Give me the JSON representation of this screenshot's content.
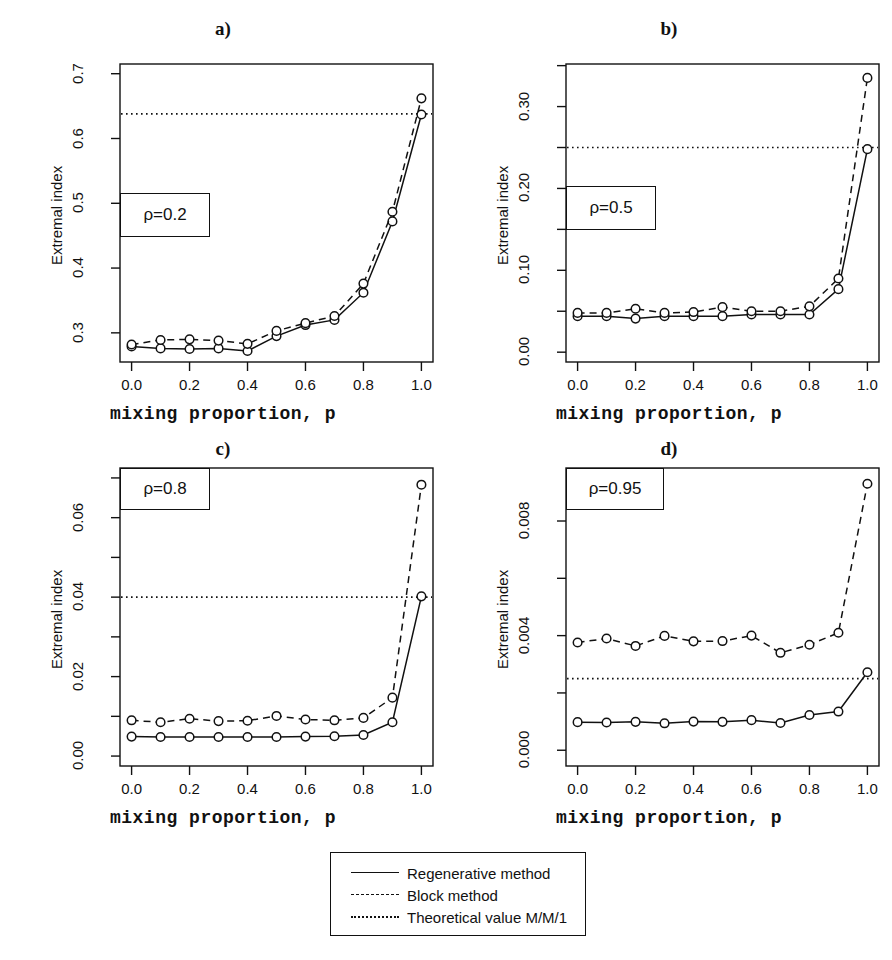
{
  "figure": {
    "width": 892,
    "height": 960,
    "background": "#ffffff",
    "ink_color": "#111111"
  },
  "legend": {
    "name": "figure-legend",
    "entries": [
      {
        "style": "solid",
        "label": "Regenerative method"
      },
      {
        "style": "dashed",
        "label": "Block method"
      },
      {
        "style": "dotted",
        "label": "Theoretical value M/M/1"
      }
    ]
  },
  "chart_data": [
    {
      "panel": "a",
      "type": "line",
      "title": "a)",
      "annotation": "ρ=0.2",
      "xlabel": "mixing proportion, p",
      "ylabel": "Extremal index",
      "x": [
        0.0,
        0.1,
        0.2,
        0.3,
        0.4,
        0.5,
        0.6,
        0.7,
        0.8,
        0.9,
        1.0
      ],
      "xlim": [
        -0.04,
        1.04
      ],
      "ylim": [
        0.255,
        0.715
      ],
      "xticks": [
        0.0,
        0.2,
        0.4,
        0.6,
        0.8,
        1.0
      ],
      "xticklabels": [
        "0.0",
        "0.2",
        "0.4",
        "0.6",
        "0.8",
        "1.0"
      ],
      "yticks": [
        0.3,
        0.4,
        0.5,
        0.6,
        0.7
      ],
      "yticklabels": [
        "0.3",
        "0.4",
        "0.5",
        "0.6",
        "0.7"
      ],
      "grid": false,
      "series": [
        {
          "name": "Regenerative method",
          "style": "solid",
          "values": [
            0.279,
            0.276,
            0.275,
            0.276,
            0.272,
            0.295,
            0.312,
            0.32,
            0.362,
            0.472,
            0.637
          ]
        },
        {
          "name": "Block method",
          "style": "dashed",
          "values": [
            0.282,
            0.289,
            0.29,
            0.288,
            0.283,
            0.303,
            0.315,
            0.326,
            0.376,
            0.487,
            0.662
          ]
        }
      ],
      "hline": {
        "name": "Theoretical value M/M/1",
        "style": "dotted",
        "value": 0.638
      }
    },
    {
      "panel": "b",
      "type": "line",
      "title": "b)",
      "annotation": "ρ=0.5",
      "xlabel": "mixing proportion, p",
      "ylabel": "Extremal index",
      "x": [
        0.0,
        0.1,
        0.2,
        0.3,
        0.4,
        0.5,
        0.6,
        0.7,
        0.8,
        0.9,
        1.0
      ],
      "xlim": [
        -0.04,
        1.04
      ],
      "ylim": [
        -0.012,
        0.352
      ],
      "xticks": [
        0.0,
        0.2,
        0.4,
        0.6,
        0.8,
        1.0
      ],
      "xticklabels": [
        "0.0",
        "0.2",
        "0.4",
        "0.6",
        "0.8",
        "1.0"
      ],
      "yticks": [
        0.0,
        0.1,
        0.2,
        0.3
      ],
      "yticklabels": [
        "0.00",
        "0.10",
        "0.20",
        "0.30"
      ],
      "yminorticks": [
        0.05,
        0.15,
        0.25,
        0.35
      ],
      "grid": false,
      "series": [
        {
          "name": "Regenerative method",
          "style": "solid",
          "values": [
            0.044,
            0.044,
            0.041,
            0.044,
            0.044,
            0.044,
            0.046,
            0.046,
            0.046,
            0.077,
            0.248
          ]
        },
        {
          "name": "Block method",
          "style": "dashed",
          "values": [
            0.048,
            0.048,
            0.053,
            0.048,
            0.049,
            0.055,
            0.05,
            0.05,
            0.056,
            0.09,
            0.335
          ]
        }
      ],
      "hline": {
        "name": "Theoretical value M/M/1",
        "style": "dotted",
        "value": 0.25
      }
    },
    {
      "panel": "c",
      "type": "line",
      "title": "c)",
      "annotation": "ρ=0.8",
      "xlabel": "mixing proportion, p",
      "ylabel": "Extremal index",
      "x": [
        0.0,
        0.1,
        0.2,
        0.3,
        0.4,
        0.5,
        0.6,
        0.7,
        0.8,
        0.9,
        1.0
      ],
      "xlim": [
        -0.04,
        1.04
      ],
      "ylim": [
        -0.0025,
        0.0725
      ],
      "xticks": [
        0.0,
        0.2,
        0.4,
        0.6,
        0.8,
        1.0
      ],
      "xticklabels": [
        "0.0",
        "0.2",
        "0.4",
        "0.6",
        "0.8",
        "1.0"
      ],
      "yticks": [
        0.0,
        0.02,
        0.04,
        0.06
      ],
      "yticklabels": [
        "0.00",
        "0.02",
        "0.04",
        "0.06"
      ],
      "yminorticks": [
        0.01,
        0.03,
        0.05,
        0.07
      ],
      "grid": false,
      "series": [
        {
          "name": "Regenerative method",
          "style": "solid",
          "values": [
            0.0049,
            0.0048,
            0.0048,
            0.0048,
            0.0048,
            0.0048,
            0.0049,
            0.005,
            0.0053,
            0.0085,
            0.0402
          ]
        },
        {
          "name": "Block method",
          "style": "dashed",
          "values": [
            0.009,
            0.0085,
            0.0094,
            0.0088,
            0.0089,
            0.0101,
            0.0092,
            0.009,
            0.0096,
            0.0147,
            0.0683
          ]
        }
      ],
      "hline": {
        "name": "Theoretical value M/M/1",
        "style": "dotted",
        "value": 0.04
      }
    },
    {
      "panel": "d",
      "type": "line",
      "title": "d)",
      "annotation": "ρ=0.95",
      "xlabel": "mixing proportion, p",
      "ylabel": "Extremal index",
      "x": [
        0.0,
        0.1,
        0.2,
        0.3,
        0.4,
        0.5,
        0.6,
        0.7,
        0.8,
        0.9,
        1.0
      ],
      "xlim": [
        -0.04,
        1.04
      ],
      "ylim": [
        -0.00055,
        0.00985
      ],
      "xticks": [
        0.0,
        0.2,
        0.4,
        0.6,
        0.8,
        1.0
      ],
      "xticklabels": [
        "0.0",
        "0.2",
        "0.4",
        "0.6",
        "0.8",
        "1.0"
      ],
      "yticks": [
        0.0,
        0.004,
        0.008
      ],
      "yticklabels": [
        "0.000",
        "0.004",
        "0.008"
      ],
      "yminorticks": [
        0.002,
        0.006
      ],
      "grid": false,
      "series": [
        {
          "name": "Regenerative method",
          "style": "solid",
          "values": [
            0.00098,
            0.00097,
            0.00099,
            0.00094,
            0.001,
            0.00099,
            0.00105,
            0.00095,
            0.00123,
            0.00135,
            0.00272
          ]
        },
        {
          "name": "Block method",
          "style": "dashed",
          "values": [
            0.00376,
            0.0039,
            0.00364,
            0.00399,
            0.0038,
            0.00381,
            0.004,
            0.0034,
            0.00368,
            0.0041,
            0.0093
          ]
        }
      ],
      "hline": {
        "name": "Theoretical value M/M/1",
        "style": "dotted",
        "value": 0.0025
      }
    }
  ]
}
